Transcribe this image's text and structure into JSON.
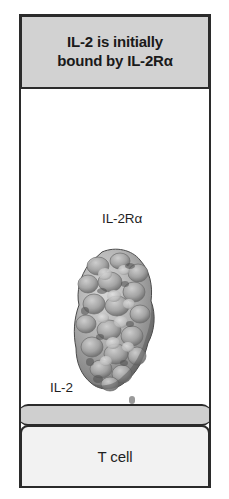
{
  "figure": {
    "header": {
      "title": "IL-2 is initially\nbound by IL-2Rα"
    },
    "labels": {
      "receptor": "IL-2Rα",
      "cytokine": "IL-2",
      "cell": "T cell"
    },
    "graphics": {
      "protein_surface": "molecular-surface-icon",
      "stalk": "dashed-stalk-icon",
      "membrane": "cell-membrane-icon"
    },
    "colors": {
      "header_fill": "#d2d2d2",
      "border": "#2b2b2b",
      "stage_fill": "#ffffff",
      "membrane_fill": "#cfcfcf",
      "cell_fill": "#f2f2f2",
      "stalk": "#9a9a9a",
      "protein_light": "#c9c9c9",
      "protein_mid": "#9e9e9e",
      "protein_dark": "#5e5e5e"
    }
  }
}
